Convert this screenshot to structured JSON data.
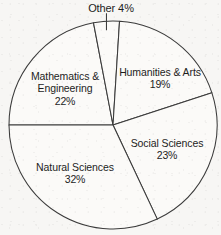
{
  "chart_data": {
    "type": "pie",
    "title": "",
    "subtitle": "",
    "xlabel": "",
    "ylabel": "",
    "legend_position": "none",
    "grid": false,
    "units": "percent",
    "total": 100,
    "categories": [
      "Mathematics & Engineering",
      "Other",
      "Humanities & Arts",
      "Social Sciences",
      "Natural Sciences"
    ],
    "values": [
      22,
      4,
      19,
      23,
      32
    ],
    "start_angle_deg": 180,
    "direction": "clockwise",
    "slices": [
      {
        "name": "Mathematics & Engineering",
        "label_line1": "Mathematics &",
        "label_line2": "Engineering",
        "value": 22,
        "pct_text": "22%",
        "start_deg": 180,
        "sweep_deg": 79.2,
        "fill": "#fbfaf8",
        "stroke": "#3b3b3b",
        "label_placement": "inside"
      },
      {
        "name": "Other",
        "label_line1": "Other 4%",
        "label_line2": "",
        "value": 4,
        "pct_text": "4%",
        "start_deg": 259.2,
        "sweep_deg": 14.4,
        "fill": "#fbfaf8",
        "stroke": "#3b3b3b",
        "label_placement": "outside-top"
      },
      {
        "name": "Humanities & Arts",
        "label_line1": "Humanities & Arts",
        "label_line2": "",
        "value": 19,
        "pct_text": "19%",
        "start_deg": 273.6,
        "sweep_deg": 68.4,
        "fill": "#fbfaf8",
        "stroke": "#3b3b3b",
        "label_placement": "inside"
      },
      {
        "name": "Social Sciences",
        "label_line1": "Social Sciences",
        "label_line2": "",
        "value": 23,
        "pct_text": "23%",
        "start_deg": 342.0,
        "sweep_deg": 82.8,
        "fill": "#fbfaf8",
        "stroke": "#3b3b3b",
        "label_placement": "inside"
      },
      {
        "name": "Natural Sciences",
        "label_line1": "Natural Sciences",
        "label_line2": "",
        "value": 32,
        "pct_text": "32%",
        "start_deg": 64.8,
        "sweep_deg": 115.2,
        "fill": "#fbfaf8",
        "stroke": "#3b3b3b",
        "label_placement": "inside"
      }
    ],
    "geometry": {
      "center_x": 113,
      "center_y": 125,
      "radius": 104
    },
    "colors": {
      "background": "#f7f6f4",
      "slice_fill": "#fbfaf8",
      "outline": "#3b3b3b",
      "text": "#1d1d1d"
    }
  }
}
